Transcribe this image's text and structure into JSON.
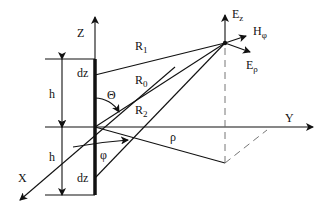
{
  "diagram": {
    "type": "dipole-geometry",
    "axes": {
      "z": "Z",
      "y": "Y",
      "x": "X"
    },
    "labels": {
      "dz_top": "dz",
      "dz_bottom": "dz",
      "h_top": "h",
      "h_bottom": "h",
      "theta": "Θ",
      "phi": "φ",
      "rho": "ρ",
      "R1": {
        "main": "R",
        "sub": "1"
      },
      "R0": {
        "main": "R",
        "sub": "0"
      },
      "R2": {
        "main": "R",
        "sub": "2"
      },
      "Ez": {
        "main": "E",
        "sub": "z"
      },
      "Hphi": {
        "main": "H",
        "sub": "φ"
      },
      "Erho": {
        "main": "E",
        "sub": "ρ"
      }
    }
  }
}
